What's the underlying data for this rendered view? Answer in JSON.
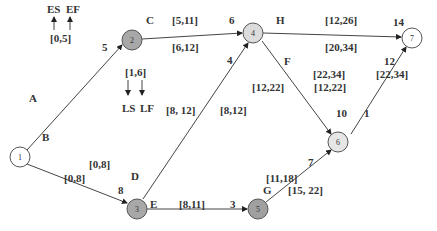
{
  "legend": {
    "es": "ES",
    "ef": "EF",
    "ls": "LS",
    "lf": "LF",
    "early_example": "[0,5]",
    "late_example": "[1,6]"
  },
  "nodes": [
    {
      "id": "1",
      "x": 20,
      "y": 157,
      "r": 10,
      "fill": "#ffffff"
    },
    {
      "id": "2",
      "x": 132,
      "y": 40,
      "r": 10,
      "fill": "#a8a8a8"
    },
    {
      "id": "4",
      "x": 253,
      "y": 33,
      "r": 10,
      "fill": "#dcdcdc"
    },
    {
      "id": "7",
      "x": 412,
      "y": 38,
      "r": 10,
      "fill": "#ffffff"
    },
    {
      "id": "6",
      "x": 338,
      "y": 142,
      "r": 10,
      "fill": "#e6e6e6"
    },
    {
      "id": "3",
      "x": 137,
      "y": 208,
      "r": 10,
      "fill": "#a8a8a8"
    },
    {
      "id": "5",
      "x": 258,
      "y": 208,
      "r": 10,
      "fill": "#a0a0a0"
    }
  ],
  "activities": [
    {
      "name": "A",
      "from": "1",
      "to": "2",
      "duration": "5",
      "early": "",
      "late": ""
    },
    {
      "name": "B",
      "from": "1",
      "to": "3",
      "duration": "8",
      "early": "[0,8]",
      "late": "[0,8]"
    },
    {
      "name": "C",
      "from": "2",
      "to": "4",
      "duration": "6",
      "early": "[5,11]",
      "late": "[6,12]"
    },
    {
      "name": "D",
      "from": "3",
      "to": "4",
      "duration": "4",
      "early": "[8, 12]",
      "late": "[8,12]"
    },
    {
      "name": "E",
      "from": "3",
      "to": "5",
      "duration": "3",
      "early": "[8,11]",
      "late": ""
    },
    {
      "name": "F",
      "from": "4",
      "to": "6",
      "duration": "10",
      "early": "[12,22]",
      "late": "[22,34]"
    },
    {
      "name": "G",
      "from": "5",
      "to": "6",
      "duration": "7",
      "early": "[11,18]",
      "late": "[15, 22]"
    },
    {
      "name": "H",
      "from": "4",
      "to": "7",
      "duration": "14",
      "early": "[12,26]",
      "late": "[20,34]"
    },
    {
      "name": "1",
      "from": "6",
      "to": "7",
      "duration": "12",
      "early": "[22,34]",
      "late": ""
    }
  ],
  "extra_labels": {
    "f_second": "[12,22]",
    "d_left": "[12,22]"
  }
}
